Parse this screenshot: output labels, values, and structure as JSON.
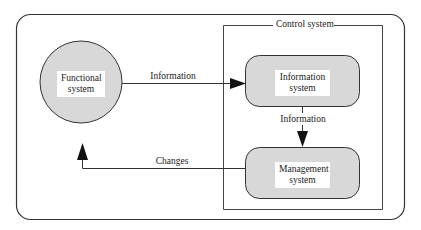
{
  "diagram": {
    "container_title": "Control system",
    "nodes": {
      "functional": {
        "line1": "Functional",
        "line2": "system",
        "shape": "circle"
      },
      "information": {
        "line1": "Information",
        "line2": "system",
        "shape": "rounded-rect"
      },
      "management": {
        "line1": "Management",
        "line2": "system",
        "shape": "rounded-rect"
      }
    },
    "edges": {
      "functional_to_information": {
        "label": "Information"
      },
      "information_to_management": {
        "label": "Information"
      },
      "management_to_functional": {
        "label": "Changes"
      }
    },
    "colors": {
      "node_fill": "#d8d8d8",
      "stroke": "#333333",
      "background": "#ffffff"
    }
  }
}
